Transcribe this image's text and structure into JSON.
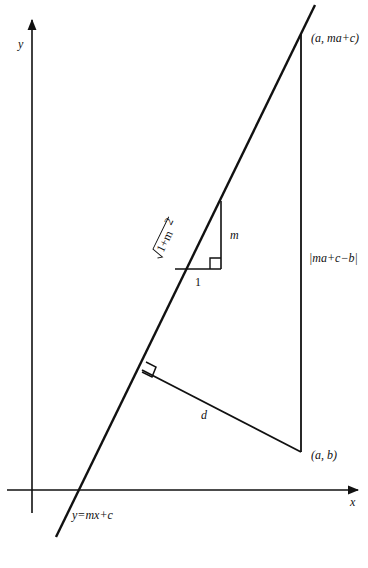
{
  "diagram": {
    "axes": {
      "x_label": "x",
      "y_label": "y"
    },
    "line": {
      "equation_label": "y=mx+c"
    },
    "points": {
      "upper_point_label": "(a, ma+c)",
      "lower_point_label": "(a, b)"
    },
    "segments": {
      "vertical_segment_label": "|ma+c−b|",
      "distance_label": "d"
    },
    "gradient_triangle": {
      "run_label": "1",
      "rise_label": "m",
      "hypotenuse_label": "√(1+m²)",
      "hypotenuse_radicand": "1+m",
      "hypotenuse_exponent": "2"
    },
    "colors": {
      "ink": "#111111",
      "background": "#ffffff"
    }
  }
}
